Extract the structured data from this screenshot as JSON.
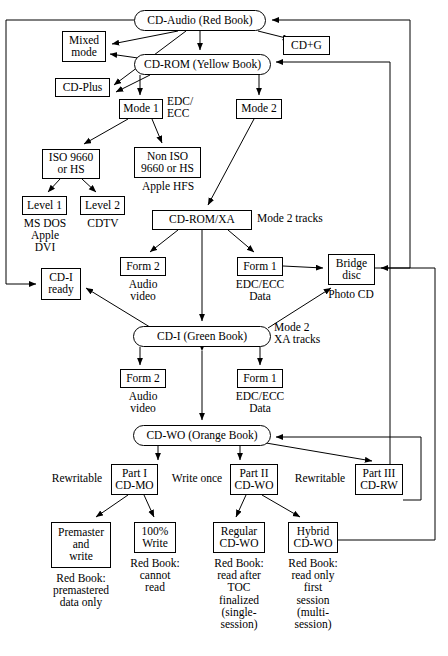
{
  "diagram": {
    "nodes": [
      {
        "id": "cd_audio",
        "label": "CD-Audio (Red Book)",
        "shape": "rounded",
        "x": 134,
        "y": 10,
        "w": 132,
        "h": 21,
        "fs": 11.5
      },
      {
        "id": "mixed_mode",
        "label": "Mixed\nmode",
        "shape": "rect",
        "x": 62,
        "y": 31,
        "w": 44,
        "h": 31,
        "fs": 11.5
      },
      {
        "id": "cd_plus",
        "label": "CD-Plus",
        "shape": "rect",
        "x": 55,
        "y": 78,
        "w": 55,
        "h": 19,
        "fs": 11.5
      },
      {
        "id": "cd_g",
        "label": "CD+G",
        "shape": "rect",
        "x": 283,
        "y": 36,
        "w": 47,
        "h": 19,
        "fs": 11.5
      },
      {
        "id": "cd_rom",
        "label": "CD-ROM (Yellow Book)",
        "shape": "rounded",
        "x": 134,
        "y": 54,
        "w": 137,
        "h": 21,
        "fs": 11.5
      },
      {
        "id": "mode1",
        "label": "Mode 1",
        "shape": "rect",
        "x": 119,
        "y": 99,
        "w": 44,
        "h": 20,
        "fs": 11.5
      },
      {
        "id": "mode2",
        "label": "Mode 2",
        "shape": "rect",
        "x": 236,
        "y": 99,
        "w": 46,
        "h": 20,
        "fs": 11.5
      },
      {
        "id": "iso9660",
        "label": "ISO 9660\nor HS",
        "shape": "rect",
        "x": 42,
        "y": 149,
        "w": 58,
        "h": 30,
        "fs": 11.5
      },
      {
        "id": "noniso",
        "label": "Non ISO\n9660 or HS",
        "shape": "rect",
        "x": 134,
        "y": 147,
        "w": 67,
        "h": 31,
        "fs": 11.5
      },
      {
        "id": "level1",
        "label": "Level 1",
        "shape": "rect",
        "x": 22,
        "y": 196,
        "w": 45,
        "h": 19,
        "fs": 11.5
      },
      {
        "id": "level2",
        "label": "Level 2",
        "shape": "rect",
        "x": 80,
        "y": 196,
        "w": 45,
        "h": 19,
        "fs": 11.5
      },
      {
        "id": "cdromxa",
        "label": "CD-ROM/XA",
        "shape": "rect",
        "x": 152,
        "y": 210,
        "w": 100,
        "h": 20,
        "fs": 11.5
      },
      {
        "id": "form2_xa",
        "label": "Form 2",
        "shape": "rect",
        "x": 120,
        "y": 257,
        "w": 46,
        "h": 19,
        "fs": 11.5
      },
      {
        "id": "form1_xa",
        "label": "Form 1",
        "shape": "rect",
        "x": 237,
        "y": 257,
        "w": 46,
        "h": 19,
        "fs": 11.5
      },
      {
        "id": "bridge",
        "label": "Bridge\ndisc",
        "shape": "rect",
        "x": 328,
        "y": 254,
        "w": 47,
        "h": 31,
        "fs": 11.5
      },
      {
        "id": "cdi_ready",
        "label": "CD-I\nready",
        "shape": "rect",
        "x": 41,
        "y": 268,
        "w": 40,
        "h": 32,
        "fs": 11.5
      },
      {
        "id": "cdi_green",
        "label": "CD-I (Green Book)",
        "shape": "rounded",
        "x": 133,
        "y": 326,
        "w": 138,
        "h": 21,
        "fs": 11.5
      },
      {
        "id": "form2_cdi",
        "label": "Form 2",
        "shape": "rect",
        "x": 120,
        "y": 369,
        "w": 46,
        "h": 19,
        "fs": 11.5
      },
      {
        "id": "form1_cdi",
        "label": "Form 1",
        "shape": "rect",
        "x": 237,
        "y": 369,
        "w": 46,
        "h": 19,
        "fs": 11.5
      },
      {
        "id": "cdwo",
        "label": "CD-WO (Orange Book)",
        "shape": "rounded",
        "x": 133,
        "y": 425,
        "w": 138,
        "h": 21,
        "fs": 11.5
      },
      {
        "id": "part1",
        "label": "Part I\nCD-MO",
        "shape": "rect",
        "x": 111,
        "y": 464,
        "w": 47,
        "h": 31,
        "fs": 11.5
      },
      {
        "id": "part2",
        "label": "Part II\nCD-WO",
        "shape": "rect",
        "x": 230,
        "y": 464,
        "w": 48,
        "h": 31,
        "fs": 11.5
      },
      {
        "id": "part3",
        "label": "Part III\nCD-RW",
        "shape": "rect",
        "x": 355,
        "y": 464,
        "w": 48,
        "h": 31,
        "fs": 11.5
      },
      {
        "id": "premaster",
        "label": "Premaster\nand\nwrite",
        "shape": "rect",
        "x": 51,
        "y": 522,
        "w": 60,
        "h": 46,
        "fs": 11.5
      },
      {
        "id": "write100",
        "label": "100%\nWrite",
        "shape": "rect",
        "x": 134,
        "y": 522,
        "w": 42,
        "h": 31,
        "fs": 11.5
      },
      {
        "id": "regular",
        "label": "Regular\nCD-WO",
        "shape": "rect",
        "x": 213,
        "y": 522,
        "w": 52,
        "h": 31,
        "fs": 11.5
      },
      {
        "id": "hybrid",
        "label": "Hybrid\nCD-WO",
        "shape": "rect",
        "x": 288,
        "y": 522,
        "w": 50,
        "h": 31,
        "fs": 11.5
      }
    ],
    "annotations": [
      {
        "id": "edc_ecc_mode1",
        "text": "EDC/\nECC",
        "x": 167,
        "y": 95,
        "w": 42,
        "align": "left",
        "fs": 11.5
      },
      {
        "id": "apple_hfs",
        "text": "Apple HFS",
        "x": 132,
        "y": 180,
        "w": 72,
        "align": "center",
        "fs": 11.5
      },
      {
        "id": "ms_dos_apple_dvi",
        "text": "MS DOS\nApple\nDVI",
        "x": 14,
        "y": 217,
        "w": 62,
        "align": "center",
        "fs": 11.5
      },
      {
        "id": "cdtv",
        "text": "CDTV",
        "x": 80,
        "y": 217,
        "w": 46,
        "align": "center",
        "fs": 11.5
      },
      {
        "id": "mode2_tracks",
        "text": "Mode 2 tracks",
        "x": 257,
        "y": 212,
        "w": 96,
        "align": "left",
        "fs": 11.5
      },
      {
        "id": "audio_video_xa",
        "text": "Audio\nvideo",
        "x": 113,
        "y": 278,
        "w": 60,
        "align": "center",
        "fs": 11.5
      },
      {
        "id": "edc_ecc_data_xa",
        "text": "EDC/ECC\nData",
        "x": 228,
        "y": 278,
        "w": 64,
        "align": "center",
        "fs": 11.5
      },
      {
        "id": "photo_cd",
        "text": "Photo CD",
        "x": 318,
        "y": 288,
        "w": 66,
        "align": "center",
        "fs": 11.5
      },
      {
        "id": "mode2_xa_tracks",
        "text": "Mode 2\nXA tracks",
        "x": 274,
        "y": 321,
        "w": 70,
        "align": "left",
        "fs": 11.5
      },
      {
        "id": "audio_video_cdi",
        "text": "Audio\nvideo",
        "x": 113,
        "y": 390,
        "w": 60,
        "align": "center",
        "fs": 11.5
      },
      {
        "id": "edc_ecc_data_cdi",
        "text": "EDC/ECC\nData",
        "x": 228,
        "y": 390,
        "w": 64,
        "align": "center",
        "fs": 11.5
      },
      {
        "id": "rewritable_1",
        "text": "Rewritable",
        "x": 44,
        "y": 472,
        "w": 66,
        "align": "center",
        "fs": 11.5
      },
      {
        "id": "write_once",
        "text": "Write once",
        "x": 163,
        "y": 472,
        "w": 68,
        "align": "center",
        "fs": 11.5
      },
      {
        "id": "rewritable_2",
        "text": "Rewritable",
        "x": 287,
        "y": 472,
        "w": 66,
        "align": "center",
        "fs": 11.5
      },
      {
        "id": "premaster_note",
        "text": "Red Book:\npremastered\ndata only",
        "x": 40,
        "y": 572,
        "w": 82,
        "align": "center",
        "fs": 11.5
      },
      {
        "id": "write100_note",
        "text": "Red Book:\ncannot\nread",
        "x": 124,
        "y": 557,
        "w": 62,
        "align": "center",
        "fs": 11.5
      },
      {
        "id": "regular_note",
        "text": "Red Book:\nread after\nTOC\nfinalized\n(single-\nsession)",
        "x": 206,
        "y": 557,
        "w": 66,
        "align": "center",
        "fs": 11.5
      },
      {
        "id": "hybrid_note",
        "text": "Red Book:\nread only\nfirst\nsession\n(multi-\nsession)",
        "x": 281,
        "y": 557,
        "w": 64,
        "align": "center",
        "fs": 11.5
      }
    ],
    "edges": [
      {
        "from": "cd_audio",
        "to": "mixed_mode",
        "kind": "arrow"
      },
      {
        "from": "cd_audio",
        "to": "cd_plus",
        "kind": "arrow"
      },
      {
        "from": "cd_audio",
        "to": "cd_g",
        "kind": "arrow"
      },
      {
        "from": "cd_audio",
        "to": "cd_rom",
        "kind": "arrow"
      },
      {
        "from": "cd_rom",
        "to": "mixed_mode",
        "kind": "arrow"
      },
      {
        "from": "cd_rom",
        "to": "cd_plus",
        "kind": "arrow"
      },
      {
        "from": "cd_rom",
        "to": "mode1",
        "kind": "arrow"
      },
      {
        "from": "cd_rom",
        "to": "mode2",
        "kind": "arrow"
      },
      {
        "from": "mode1",
        "to": "iso9660",
        "kind": "arrow"
      },
      {
        "from": "mode1",
        "to": "noniso",
        "kind": "arrow"
      },
      {
        "from": "iso9660",
        "to": "level1",
        "kind": "arrow"
      },
      {
        "from": "iso9660",
        "to": "level2",
        "kind": "arrow"
      },
      {
        "from": "mode2",
        "to": "cdromxa",
        "kind": "arrow"
      },
      {
        "from": "cdromxa",
        "to": "form2_xa",
        "kind": "arrow"
      },
      {
        "from": "cdromxa",
        "to": "form1_xa",
        "kind": "arrow"
      },
      {
        "from": "cdromxa",
        "to": "cdi_green",
        "kind": "arrow"
      },
      {
        "from": "form1_xa",
        "to": "bridge",
        "kind": "arrow"
      },
      {
        "from": "cd_audio",
        "to": "cdi_ready",
        "kind": "routed-left"
      },
      {
        "from": "cdi_green",
        "to": "cdi_ready",
        "kind": "arrow"
      },
      {
        "from": "cdi_green",
        "to": "bridge",
        "kind": "arrow"
      },
      {
        "from": "cdi_green",
        "to": "form2_cdi",
        "kind": "arrow"
      },
      {
        "from": "cdi_green",
        "to": "form1_cdi",
        "kind": "arrow"
      },
      {
        "from": "cdi_green",
        "to": "cdwo",
        "kind": "bidirectional"
      },
      {
        "from": "cdwo",
        "to": "part1",
        "kind": "arrow"
      },
      {
        "from": "cdwo",
        "to": "part2",
        "kind": "arrow"
      },
      {
        "from": "cdwo",
        "to": "part3",
        "kind": "arrow"
      },
      {
        "from": "part1",
        "to": "premaster",
        "kind": "arrow"
      },
      {
        "from": "part1",
        "to": "write100",
        "kind": "arrow"
      },
      {
        "from": "part2",
        "to": "regular",
        "kind": "arrow"
      },
      {
        "from": "part2",
        "to": "hybrid",
        "kind": "arrow"
      },
      {
        "from": "hybrid",
        "to": "bridge",
        "kind": "routed-right"
      },
      {
        "from": "part3",
        "to": "cd_rom",
        "kind": "routed-right"
      },
      {
        "from": "bridge",
        "to": "cd_audio",
        "kind": "routed-right"
      },
      {
        "from": "hybrid",
        "to": "cdwo",
        "kind": "routed-right"
      }
    ]
  }
}
